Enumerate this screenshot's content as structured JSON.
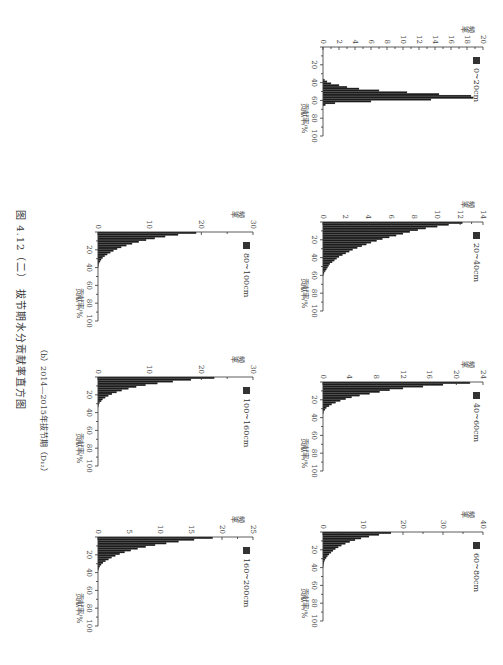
{
  "figure": {
    "subtitle": "（b）2014—2015年拔节期（D₁₂）",
    "caption": "图 4.12（二） 拔节期水分贡献率直方图"
  },
  "axis_labels": {
    "x": "贡献率/%",
    "y": "频率"
  },
  "chart_data": [
    {
      "type": "bar",
      "title": "0~20cm",
      "legend": "0~20cm",
      "xlabel": "贡献率/%",
      "ylabel": "频率",
      "xlim": [
        0,
        100
      ],
      "ylim": [
        0,
        20
      ],
      "xticks": [
        20,
        40,
        60,
        80,
        100
      ],
      "yticks": [
        0,
        2,
        4,
        6,
        8,
        10,
        12,
        14,
        16,
        18,
        20
      ],
      "bin_width": 2,
      "x": [
        36,
        38,
        40,
        42,
        44,
        46,
        48,
        50,
        52,
        54,
        56,
        58,
        60,
        62,
        64
      ],
      "values": [
        0.2,
        0.5,
        1.0,
        2.0,
        3.0,
        4.5,
        7.0,
        10.5,
        14.5,
        18.5,
        18.8,
        13.5,
        6.0,
        1.5,
        0.3
      ]
    },
    {
      "type": "bar",
      "title": "20~40cm",
      "legend": "20~40cm",
      "xlabel": "贡献率/%",
      "ylabel": "频率",
      "xlim": [
        0,
        100
      ],
      "ylim": [
        0,
        14
      ],
      "xticks": [
        20,
        40,
        60,
        80,
        100
      ],
      "yticks": [
        0,
        2,
        4,
        6,
        8,
        10,
        12,
        14
      ],
      "bin_width": 2,
      "x": [
        0,
        2,
        4,
        6,
        8,
        10,
        12,
        14,
        16,
        18,
        20,
        22,
        24,
        26,
        28,
        30,
        32,
        34,
        36,
        38,
        40,
        42,
        44,
        46,
        48,
        50,
        52,
        54,
        56,
        58
      ],
      "values": [
        12.2,
        11.0,
        10.0,
        9.0,
        8.3,
        7.6,
        7.0,
        6.4,
        5.8,
        5.2,
        4.7,
        4.2,
        3.8,
        3.4,
        3.0,
        2.6,
        2.3,
        2.0,
        1.7,
        1.4,
        1.2,
        1.0,
        0.8,
        0.6,
        0.5,
        0.4,
        0.3,
        0.2,
        0.1,
        0.05
      ]
    },
    {
      "type": "bar",
      "title": "40~60cm",
      "legend": "40~60cm",
      "xlabel": "贡献率/%",
      "ylabel": "频率",
      "xlim": [
        0,
        100
      ],
      "ylim": [
        0,
        24
      ],
      "xticks": [
        20,
        40,
        60,
        80,
        100
      ],
      "yticks": [
        0,
        4,
        8,
        12,
        16,
        20,
        24
      ],
      "bin_width": 2,
      "x": [
        0,
        2,
        4,
        6,
        8,
        10,
        12,
        14,
        16,
        18,
        20,
        22,
        24,
        26,
        28,
        30,
        32,
        34
      ],
      "values": [
        22.0,
        18.0,
        15.0,
        12.0,
        10.0,
        8.5,
        7.0,
        5.5,
        4.3,
        3.4,
        2.6,
        1.9,
        1.3,
        0.9,
        0.5,
        0.3,
        0.1,
        0.05
      ]
    },
    {
      "type": "bar",
      "title": "60~80cm",
      "legend": "60~80cm",
      "xlabel": "贡献率/%",
      "ylabel": "频率",
      "xlim": [
        0,
        100
      ],
      "ylim": [
        0,
        40
      ],
      "xticks": [
        20,
        40,
        60,
        80,
        100
      ],
      "yticks": [
        0,
        10,
        20,
        30,
        40
      ],
      "bin_width": 2,
      "x": [
        0,
        2,
        4,
        6,
        8,
        10,
        12,
        14,
        16,
        18,
        20,
        22,
        24,
        26,
        28,
        30,
        32,
        34,
        36,
        38
      ],
      "values": [
        17.0,
        14.0,
        11.5,
        9.5,
        8.0,
        6.7,
        5.6,
        4.6,
        3.8,
        3.1,
        2.5,
        2.0,
        1.5,
        1.1,
        0.8,
        0.5,
        0.3,
        0.2,
        0.1,
        0.05
      ]
    },
    {
      "type": "bar",
      "title": "80~100cm",
      "legend": "80~100cm",
      "xlabel": "贡献率/%",
      "ylabel": "频率",
      "xlim": [
        0,
        100
      ],
      "ylim": [
        0,
        30
      ],
      "xticks": [
        20,
        40,
        60,
        80,
        100
      ],
      "yticks": [
        0,
        10,
        20,
        30
      ],
      "bin_width": 2,
      "x": [
        0,
        2,
        4,
        6,
        8,
        10,
        12,
        14,
        16,
        18,
        20,
        22,
        24,
        26,
        28,
        30,
        32,
        34,
        36,
        38
      ],
      "values": [
        19.0,
        15.5,
        13.0,
        11.0,
        9.3,
        7.9,
        6.6,
        5.5,
        4.5,
        3.7,
        3.0,
        2.4,
        1.8,
        1.3,
        0.9,
        0.6,
        0.4,
        0.2,
        0.1,
        0.05
      ]
    },
    {
      "type": "bar",
      "title": "100~160cm",
      "legend": "100~160cm",
      "xlabel": "贡献率/%",
      "ylabel": "频率",
      "xlim": [
        0,
        100
      ],
      "ylim": [
        0,
        30
      ],
      "xticks": [
        20,
        40,
        60,
        80,
        100
      ],
      "yticks": [
        0,
        10,
        20,
        30
      ],
      "bin_width": 2,
      "x": [
        0,
        2,
        4,
        6,
        8,
        10,
        12,
        14,
        16,
        18,
        20,
        22,
        24,
        26,
        28,
        30,
        32
      ],
      "values": [
        22.5,
        18.0,
        14.5,
        11.5,
        9.2,
        7.4,
        5.9,
        4.6,
        3.6,
        2.7,
        2.0,
        1.4,
        0.9,
        0.6,
        0.3,
        0.15,
        0.05
      ]
    },
    {
      "type": "bar",
      "title": "160~200cm",
      "legend": "160~200cm",
      "xlabel": "贡献率/%",
      "ylabel": "频率",
      "xlim": [
        0,
        100
      ],
      "ylim": [
        0,
        25
      ],
      "xticks": [
        20,
        40,
        60,
        80,
        100
      ],
      "yticks": [
        0,
        5,
        10,
        15,
        20,
        25
      ],
      "bin_width": 2,
      "x": [
        0,
        2,
        4,
        6,
        8,
        10,
        12,
        14,
        16,
        18,
        20,
        22,
        24,
        26,
        28,
        30,
        32,
        34,
        36
      ],
      "values": [
        18.5,
        15.5,
        13.0,
        11.0,
        9.2,
        7.7,
        6.4,
        5.3,
        4.3,
        3.5,
        2.8,
        2.2,
        1.7,
        1.2,
        0.8,
        0.5,
        0.3,
        0.15,
        0.05
      ]
    }
  ]
}
